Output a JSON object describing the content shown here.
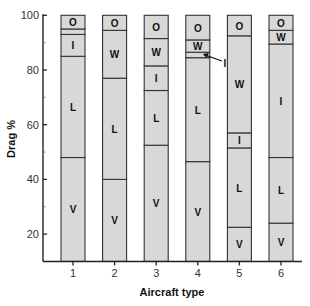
{
  "chart_data": {
    "type": "bar",
    "stacked": true,
    "title": "",
    "xlabel": "Aircraft type",
    "ylabel": "Drag %",
    "ylim": [
      10,
      100
    ],
    "yticks": [
      20,
      40,
      60,
      80,
      100
    ],
    "yminor_ticks": [
      30,
      50,
      70,
      90
    ],
    "categories": [
      "1",
      "2",
      "3",
      "4",
      "5",
      "6"
    ],
    "grid": false,
    "legend": "none (segments labelled inline)",
    "segment_codes": [
      "V",
      "L",
      "I",
      "W",
      "O"
    ],
    "fill_color": "#d8d8d8",
    "outline_color": "#333333",
    "bars": [
      {
        "category": "1",
        "segments": [
          {
            "label": "V",
            "from": 10,
            "to": 48
          },
          {
            "label": "L",
            "from": 48,
            "to": 85
          },
          {
            "label": "I",
            "from": 85,
            "to": 93
          },
          {
            "label": "W",
            "from": 93,
            "to": 95
          },
          {
            "label": "O",
            "from": 95,
            "to": 100
          }
        ]
      },
      {
        "category": "2",
        "segments": [
          {
            "label": "V",
            "from": 10,
            "to": 40
          },
          {
            "label": "L",
            "from": 40,
            "to": 77
          },
          {
            "label": "W",
            "from": 77,
            "to": 94.5
          },
          {
            "label": "O",
            "from": 94.5,
            "to": 100
          }
        ]
      },
      {
        "category": "3",
        "segments": [
          {
            "label": "V",
            "from": 10,
            "to": 52.5
          },
          {
            "label": "L",
            "from": 52.5,
            "to": 72.5
          },
          {
            "label": "I",
            "from": 72.5,
            "to": 81.5
          },
          {
            "label": "W",
            "from": 81.5,
            "to": 91.5
          },
          {
            "label": "O",
            "from": 91.5,
            "to": 100
          }
        ]
      },
      {
        "category": "4",
        "segments": [
          {
            "label": "V",
            "from": 10,
            "to": 46.5
          },
          {
            "label": "L",
            "from": 46.5,
            "to": 84.5
          },
          {
            "label": "I",
            "from": 84.5,
            "to": 86.5,
            "callout": true
          },
          {
            "label": "W",
            "from": 86.5,
            "to": 91
          },
          {
            "label": "O",
            "from": 91,
            "to": 100
          }
        ]
      },
      {
        "category": "5",
        "segments": [
          {
            "label": "V",
            "from": 10,
            "to": 22.5
          },
          {
            "label": "L",
            "from": 22.5,
            "to": 51.5
          },
          {
            "label": "I",
            "from": 51.5,
            "to": 57
          },
          {
            "label": "W",
            "from": 57,
            "to": 92.5
          },
          {
            "label": "O",
            "from": 92.5,
            "to": 100
          }
        ]
      },
      {
        "category": "6",
        "segments": [
          {
            "label": "V",
            "from": 10,
            "to": 24
          },
          {
            "label": "L",
            "from": 24,
            "to": 48
          },
          {
            "label": "I",
            "from": 48,
            "to": 89.5
          },
          {
            "label": "W",
            "from": 89.5,
            "to": 94.5
          },
          {
            "label": "O",
            "from": 94.5,
            "to": 100
          }
        ]
      }
    ]
  }
}
